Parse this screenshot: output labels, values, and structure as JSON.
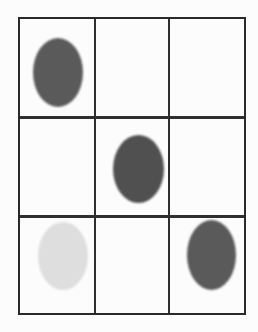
{
  "grid": {
    "rows": 3,
    "cols": 3,
    "line_color": "#2f2f2f",
    "background": "#fcfcfc"
  },
  "cells": [
    {
      "row": 0,
      "col": 0,
      "mark": "dark-oval",
      "color": "#5a5a5a"
    },
    {
      "row": 0,
      "col": 1,
      "mark": "empty"
    },
    {
      "row": 0,
      "col": 2,
      "mark": "empty"
    },
    {
      "row": 1,
      "col": 0,
      "mark": "empty"
    },
    {
      "row": 1,
      "col": 1,
      "mark": "dark-oval",
      "color": "#505050"
    },
    {
      "row": 1,
      "col": 2,
      "mark": "empty"
    },
    {
      "row": 2,
      "col": 0,
      "mark": "faint-oval",
      "color": "#dedede"
    },
    {
      "row": 2,
      "col": 1,
      "mark": "empty"
    },
    {
      "row": 2,
      "col": 2,
      "mark": "dark-oval",
      "color": "#5a5a5a"
    }
  ]
}
